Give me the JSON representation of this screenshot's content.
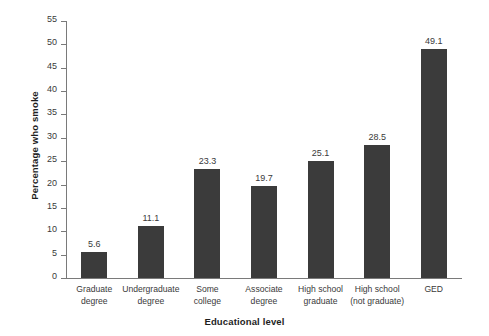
{
  "chart_data": {
    "type": "bar",
    "title": "",
    "xlabel": "Educational level",
    "ylabel": "Percentage who smoke",
    "categories": [
      "Graduate degree",
      "Undergraduate degree",
      "Some college",
      "Associate degree",
      "High school graduate",
      "High school (not graduate)",
      "GED"
    ],
    "category_lines": [
      [
        "Graduate",
        "degree"
      ],
      [
        "Undergraduate",
        "degree"
      ],
      [
        "Some",
        "college"
      ],
      [
        "Associate",
        "degree"
      ],
      [
        "High school",
        "graduate"
      ],
      [
        "High school",
        "(not graduate)"
      ],
      [
        "GED",
        ""
      ]
    ],
    "values": [
      5.6,
      11.1,
      23.3,
      19.7,
      25.1,
      28.5,
      49.1
    ],
    "value_labels": [
      "5.6",
      "11.1",
      "23.3",
      "19.7",
      "25.1",
      "28.5",
      "49.1"
    ],
    "ylim": [
      0,
      55
    ],
    "ytick_values": [
      0,
      5,
      10,
      15,
      20,
      25,
      30,
      35,
      40,
      45,
      50,
      55
    ],
    "ytick_labels": [
      "0",
      "5",
      "10",
      "15",
      "20",
      "25",
      "30",
      "35",
      "40",
      "45",
      "50",
      "55"
    ],
    "grid": false,
    "legend": false,
    "bar_color": "#3b3b3b",
    "axis_color": "#7a7a7a",
    "text_color": "#3a3a3a",
    "background": "#ffffff"
  }
}
